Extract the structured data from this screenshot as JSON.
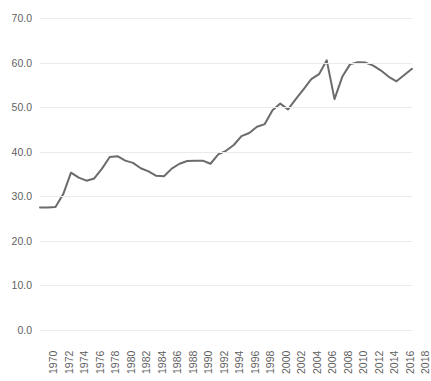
{
  "chart_data": {
    "type": "line",
    "title": "",
    "xlabel": "",
    "ylabel": "",
    "ylim": [
      0.0,
      70.0
    ],
    "xlim": [
      1970,
      2018
    ],
    "grid": true,
    "legend": false,
    "legend_position": "none",
    "y_ticks": [
      "70.0",
      "60.0",
      "50.0",
      "40.0",
      "30.0",
      "20.0",
      "10.0",
      "0.0"
    ],
    "y_tick_values": [
      70.0,
      60.0,
      50.0,
      40.0,
      30.0,
      20.0,
      10.0,
      0.0
    ],
    "x_tick_labels": [
      "1970",
      "1972",
      "1974",
      "1976",
      "1978",
      "1980",
      "1982",
      "1984",
      "1986",
      "1988",
      "1990",
      "1992",
      "1994",
      "1996",
      "1998",
      "2000",
      "2002",
      "2004",
      "2006",
      "2008",
      "2010",
      "2012",
      "2014",
      "2016",
      "2018"
    ],
    "x_tick_interval": 2,
    "line_color": "#6b6b6b",
    "grid_color": "#eceaee",
    "tick_label_color": "#5f5f5f",
    "x": [
      1970,
      1971,
      1972,
      1973,
      1974,
      1975,
      1976,
      1977,
      1978,
      1979,
      1980,
      1981,
      1982,
      1983,
      1984,
      1985,
      1986,
      1987,
      1988,
      1989,
      1990,
      1991,
      1992,
      1993,
      1994,
      1995,
      1996,
      1997,
      1998,
      1999,
      2000,
      2001,
      2002,
      2003,
      2004,
      2005,
      2006,
      2007,
      2008,
      2009,
      2010,
      2011,
      2012,
      2013,
      2014,
      2015,
      2016,
      2017,
      2018
    ],
    "values": [
      27.5,
      27.5,
      27.6,
      30.5,
      35.3,
      34.2,
      33.5,
      34.0,
      36.2,
      38.8,
      39.0,
      38.0,
      37.5,
      36.3,
      35.6,
      34.6,
      34.5,
      36.2,
      37.3,
      37.9,
      38.0,
      38.0,
      37.3,
      39.4,
      40.2,
      41.5,
      43.5,
      44.2,
      45.6,
      46.2,
      49.3,
      50.8,
      49.5,
      51.8,
      54.0,
      56.3,
      57.4,
      60.5,
      51.8,
      56.8,
      59.6,
      60.1,
      60.0,
      59.3,
      58.2,
      56.8,
      55.8,
      57.2,
      58.6
    ],
    "series": [
      {
        "name": "series-1",
        "values": [
          27.5,
          27.5,
          27.6,
          30.5,
          35.3,
          34.2,
          33.5,
          34.0,
          36.2,
          38.8,
          39.0,
          38.0,
          37.5,
          36.3,
          35.6,
          34.6,
          34.5,
          36.2,
          37.3,
          37.9,
          38.0,
          38.0,
          37.3,
          39.4,
          40.2,
          41.5,
          43.5,
          44.2,
          45.6,
          46.2,
          49.3,
          50.8,
          49.5,
          51.8,
          54.0,
          56.3,
          57.4,
          60.5,
          51.8,
          56.8,
          59.6,
          60.1,
          60.0,
          59.3,
          58.2,
          56.8,
          55.8,
          57.2,
          58.6
        ]
      }
    ]
  }
}
